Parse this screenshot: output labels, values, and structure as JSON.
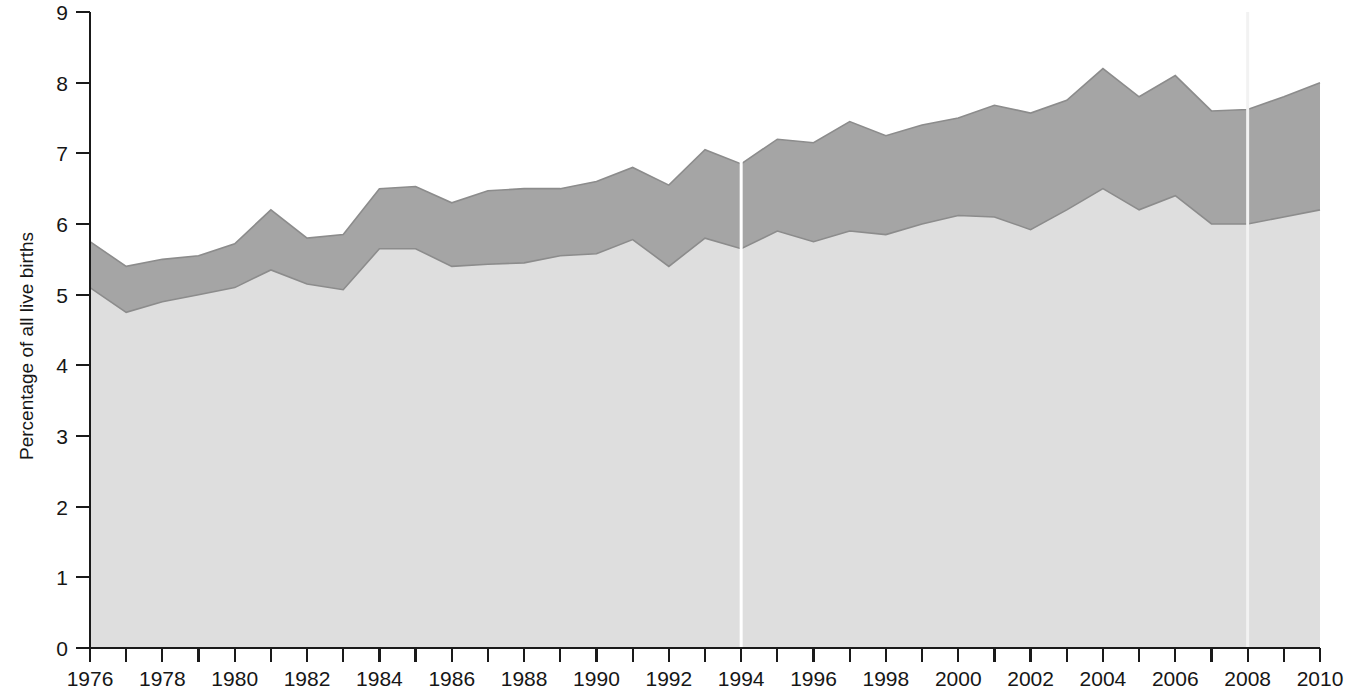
{
  "chart_data": {
    "type": "area",
    "title": "",
    "subtitle": "",
    "xlabel": "",
    "ylabel": "Percentage of all live births",
    "xlim": [
      1976,
      2010
    ],
    "ylim": [
      0,
      9
    ],
    "grid": false,
    "legend_position": "none",
    "stacked": true,
    "x": [
      1976,
      1977,
      1978,
      1979,
      1980,
      1981,
      1982,
      1983,
      1984,
      1985,
      1986,
      1987,
      1988,
      1989,
      1990,
      1991,
      1992,
      1993,
      1994,
      1995,
      1996,
      1997,
      1998,
      1999,
      2000,
      2001,
      2002,
      2003,
      2004,
      2005,
      2006,
      2007,
      2008,
      2009,
      2010
    ],
    "x_tick_labels": [
      "1976",
      "1978",
      "1980",
      "1982",
      "1984",
      "1986",
      "1988",
      "1990",
      "1992",
      "1994",
      "1996",
      "1998",
      "2000",
      "2002",
      "2004",
      "2006",
      "2008",
      "2010"
    ],
    "x_tick_values": [
      1976,
      1978,
      1980,
      1982,
      1984,
      1986,
      1988,
      1990,
      1992,
      1994,
      1996,
      1998,
      2000,
      2002,
      2004,
      2006,
      2008,
      2010
    ],
    "y_tick_labels": [
      "0",
      "1",
      "2",
      "3",
      "4",
      "5",
      "6",
      "7",
      "8",
      "9"
    ],
    "y_tick_values": [
      0,
      1,
      2,
      3,
      4,
      5,
      6,
      7,
      8,
      9
    ],
    "series": [
      {
        "name": "Lower band",
        "color": "#dedede",
        "values": [
          5.1,
          4.75,
          4.9,
          5.0,
          5.1,
          5.35,
          5.15,
          5.07,
          5.65,
          5.65,
          5.4,
          5.43,
          5.45,
          5.55,
          5.58,
          5.78,
          5.4,
          5.8,
          5.65,
          5.9,
          5.75,
          5.9,
          5.85,
          6.0,
          6.12,
          6.1,
          5.92,
          6.2,
          6.5,
          6.2,
          6.4,
          6.0,
          6.0,
          6.1,
          6.2
        ]
      },
      {
        "name": "Upper band",
        "color": "#a5a5a5",
        "values": [
          5.75,
          5.4,
          5.5,
          5.55,
          5.72,
          6.2,
          5.8,
          5.85,
          6.5,
          6.53,
          6.3,
          6.47,
          6.5,
          6.5,
          6.6,
          6.8,
          6.55,
          7.05,
          6.85,
          7.2,
          7.15,
          7.45,
          7.25,
          7.4,
          7.5,
          7.68,
          7.57,
          7.75,
          8.2,
          7.8,
          8.1,
          7.6,
          7.62,
          7.8,
          8.0
        ],
        "note": "cumulative total of both stacked bands"
      }
    ],
    "annotations": [
      {
        "type": "vertical-break-line",
        "x": 1994,
        "color": "#ffffff",
        "note": "white discontinuity marker at 1994"
      },
      {
        "type": "vertical-break-line",
        "x": 2008,
        "color": "#f2f2f2",
        "note": "faint discontinuity marker at 2008"
      }
    ]
  },
  "axes": {
    "y_axis_title": "Percentage of all live births"
  }
}
